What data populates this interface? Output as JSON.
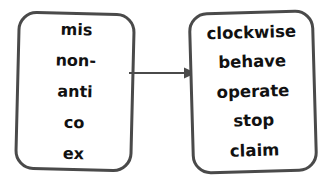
{
  "diagram": {
    "type": "prefix-to-base-word-flow",
    "background_color": "#ffffff",
    "border_color": "#4a4a4a",
    "text_color": "#111111",
    "left_box": {
      "label": "prefixes",
      "items": [
        {
          "text": "mis"
        },
        {
          "text": "non-"
        },
        {
          "text": "anti"
        },
        {
          "text": "co"
        },
        {
          "text": "ex"
        }
      ]
    },
    "connector": {
      "icon": "arrow-right-icon",
      "direction": "left-to-right",
      "color": "#4a4a4a"
    },
    "right_box": {
      "label": "base words",
      "items": [
        {
          "text": "clockwise"
        },
        {
          "text": "behave"
        },
        {
          "text": "operate"
        },
        {
          "text": "stop"
        },
        {
          "text": "claim"
        }
      ]
    }
  }
}
